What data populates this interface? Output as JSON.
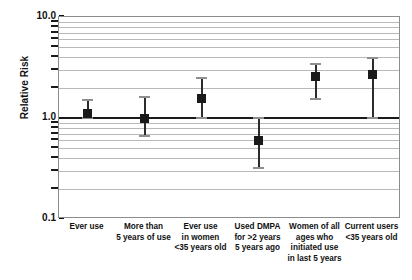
{
  "chart_data": {
    "type": "scatter",
    "title": "",
    "xlabel": "",
    "ylabel": "Relative Risk",
    "yscale": "log",
    "ylim": [
      0.1,
      10.0
    ],
    "grid": true,
    "legend": false,
    "reference_line": 1.0,
    "ytick_labels": [
      "10.0",
      "1.0",
      "0.1"
    ],
    "ytick_values": [
      10.0,
      1.0,
      0.1
    ],
    "minor_gridline_values": [
      9,
      8,
      7,
      6,
      5,
      4,
      3,
      2,
      0.9,
      0.8,
      0.7,
      0.6,
      0.5,
      0.4,
      0.3,
      0.2
    ],
    "categories": [
      "Ever use",
      "More than 5 years of use",
      "Ever use in women <35 years old",
      "Used DMPA for >2 years 5 years ago",
      "Women of all ages who initiated use in last 5 years",
      "Current users <35 years old"
    ],
    "category_lines": [
      [
        "Ever use"
      ],
      [
        "More than",
        "5 years of use"
      ],
      [
        "Ever use",
        "in women",
        "<35 years old"
      ],
      [
        "Used DMPA",
        "for >2 years",
        "5 years ago"
      ],
      [
        "Women of all",
        "ages who",
        "initiated use",
        "in last 5 years"
      ],
      [
        "Current users",
        "<35 years old"
      ]
    ],
    "values": [
      1.1,
      1.0,
      1.55,
      0.6,
      2.6,
      2.7
    ],
    "ci_lower": [
      1.0,
      0.67,
      1.0,
      0.32,
      1.55,
      1.0
    ],
    "ci_upper": [
      1.5,
      1.6,
      2.5,
      1.0,
      3.4,
      3.9
    ],
    "series": [
      {
        "name": "Relative Risk",
        "points": [
          {
            "category": "Ever use",
            "value": 1.1,
            "ci_lower": 1.0,
            "ci_upper": 1.5
          },
          {
            "category": "More than 5 years of use",
            "value": 1.0,
            "ci_lower": 0.67,
            "ci_upper": 1.6
          },
          {
            "category": "Ever use in women <35 years old",
            "value": 1.55,
            "ci_lower": 1.0,
            "ci_upper": 2.5
          },
          {
            "category": "Used DMPA for >2 years 5 years ago",
            "value": 0.6,
            "ci_lower": 0.32,
            "ci_upper": 1.0
          },
          {
            "category": "Women of all ages who initiated use in last 5 years",
            "value": 2.6,
            "ci_lower": 1.55,
            "ci_upper": 3.4
          },
          {
            "category": "Current users <35 years old",
            "value": 2.7,
            "ci_lower": 1.0,
            "ci_upper": 3.9
          }
        ]
      }
    ],
    "colors": {
      "marker": "#1a1a1a",
      "whisker": "#2b2b2b",
      "cap": "#8f8f8f",
      "gridline": "#b9b9b9",
      "reference_line": "#1a1a1a",
      "frame": "#8c8c8c",
      "text": "#111111",
      "background": "#ffffff"
    }
  }
}
